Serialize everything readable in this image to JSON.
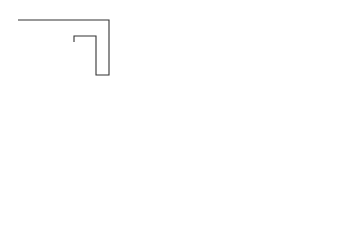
{
  "figure": {
    "panels": [
      {
        "id": "a",
        "label": "a)"
      },
      {
        "id": "b",
        "label": "b)"
      },
      {
        "id": "c",
        "label": "c)"
      },
      {
        "id": "d",
        "label": "d)"
      },
      {
        "id": "e",
        "label": "e)"
      },
      {
        "id": "f",
        "label": "f )"
      }
    ],
    "colors": {
      "line": "#333333",
      "background": "#ffffff",
      "coil_hatch": "#444444"
    }
  }
}
